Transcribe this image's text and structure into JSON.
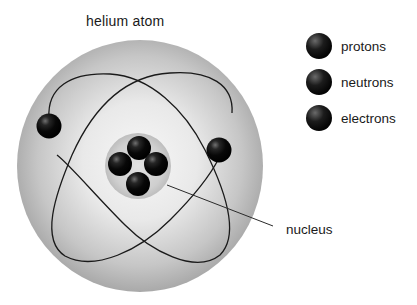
{
  "title": "helium atom",
  "legend": [
    {
      "label": "protons",
      "icon": "protons-ball-icon"
    },
    {
      "label": "neutrons",
      "icon": "neutrons-ball-icon"
    },
    {
      "label": "electrons",
      "icon": "electrons-ball-icon"
    }
  ],
  "labels": {
    "nucleus": "nucleus"
  },
  "colors": {
    "sphere_edge": "#a8a8a8",
    "sphere_center": "#f4f4f4",
    "nucleus_disk": "#c9c9c9",
    "particle": "#0a0a0a",
    "orbit": "#1a1a1a"
  },
  "diagram": {
    "nucleons": 4,
    "electrons": 2,
    "orbits": 2
  }
}
